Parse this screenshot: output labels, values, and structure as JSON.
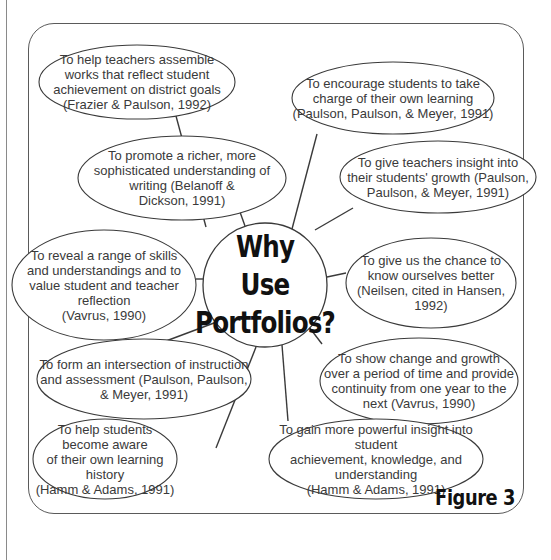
{
  "diagram": {
    "center": {
      "line1": "Why Use",
      "line2": "Portfolios?",
      "cx": 265,
      "cy": 285,
      "r": 62
    },
    "figure_label": "Figure 3",
    "stroke_color": "#3a3a3a",
    "nodes": [
      {
        "id": "assemble-works",
        "text": "To help teachers assemble\nworks that reflect student\nachievement on district goals\n(Frazier & Paulson, 1992)",
        "cx": 137,
        "cy": 82,
        "rx": 98,
        "ry": 37,
        "link": [
          [
            176,
            116
          ],
          [
            206,
            227
          ]
        ]
      },
      {
        "id": "take-charge",
        "text": "To encourage students to take\ncharge of their own learning\n(Paulson, Paulson, & Meyer, 1991)",
        "cx": 393,
        "cy": 98,
        "rx": 101,
        "ry": 36,
        "link": [
          [
            317,
            134
          ],
          [
            292,
            229
          ]
        ]
      },
      {
        "id": "richer-understanding",
        "text": "To promote a richer, more\nsophisticated understanding of\nwriting (Belanoff &\nDickson, 1991)",
        "cx": 182,
        "cy": 178,
        "rx": 104,
        "ry": 42,
        "link": [
          [
            240,
            212
          ],
          [
            245,
            226
          ]
        ]
      },
      {
        "id": "teacher-insight",
        "text": "To give teachers insight into\ntheir students' growth (Paulson,\nPaulson, & Meyer, 1991)",
        "cx": 438,
        "cy": 177,
        "rx": 98,
        "ry": 36,
        "link": [
          [
            353,
            208
          ],
          [
            315,
            230
          ]
        ]
      },
      {
        "id": "reveal-skills",
        "text": "To reveal a range of skills\nand understandings and to\nvalue student and teacher\nreflection\n(Vavrus, 1990)",
        "cx": 104,
        "cy": 285,
        "rx": 92,
        "ry": 55,
        "link": [
          [
            196,
            279
          ],
          [
            203,
            279
          ]
        ]
      },
      {
        "id": "know-ourselves",
        "text": "To give us the chance to\nknow ourselves better\n(Neilsen, cited in Hansen,\n1992)",
        "cx": 431,
        "cy": 283,
        "rx": 85,
        "ry": 45,
        "link": [
          [
            327,
            277
          ],
          [
            346,
            273
          ]
        ]
      },
      {
        "id": "show-change",
        "text": "To show change and growth\nover a period of time and provide\ncontinuity from one year to the\nnext (Vavrus, 1990)",
        "cx": 419,
        "cy": 381,
        "rx": 99,
        "ry": 43,
        "link": [
          [
            309,
            327
          ],
          [
            322,
            344
          ]
        ]
      },
      {
        "id": "intersection",
        "text": "To form an intersection of instruction\nand assessment (Paulson, Paulson,\n& Meyer, 1991)",
        "cx": 144,
        "cy": 379,
        "rx": 107,
        "ry": 40,
        "link": [
          [
            222,
            320
          ],
          [
            166,
            341
          ]
        ]
      },
      {
        "id": "powerful-insight",
        "text": "To gain more powerful insight into student\nachievement, knowledge, and understanding\n(Hamm & Adams, 1991)",
        "cx": 376,
        "cy": 459,
        "rx": 107,
        "ry": 40,
        "link": [
          [
            282,
            345
          ],
          [
            288,
            421
          ]
        ]
      },
      {
        "id": "learning-history",
        "text": "To help students become aware\nof their own learning history\n(Hamm & Adams, 1991)",
        "cx": 105,
        "cy": 459,
        "rx": 72,
        "ry": 40,
        "link": [
          [
            256,
            347
          ],
          [
            216,
            448
          ]
        ]
      }
    ]
  }
}
